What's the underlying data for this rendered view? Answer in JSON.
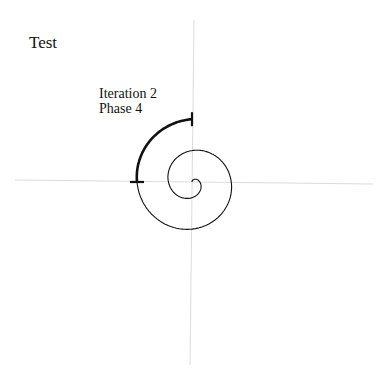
{
  "diagram": {
    "title": "Test",
    "annotation": {
      "line1": "Iteration 2",
      "line2": "Phase 4"
    },
    "axes": {
      "color": "#d9d9d9",
      "center": [
        192,
        182
      ]
    },
    "spiral": {
      "type": "archimedean",
      "color": "#111111",
      "turns": 2.0,
      "highlight": {
        "label": "Iteration 2 Phase 4",
        "from_angle_deg": 270,
        "to_angle_deg": 360
      }
    }
  }
}
